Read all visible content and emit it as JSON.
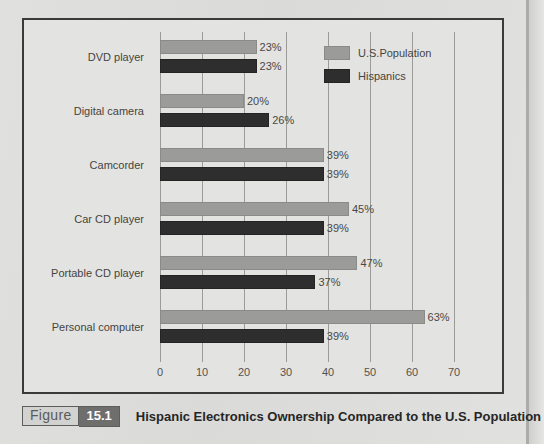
{
  "figure": {
    "label_word": "Figure",
    "number": "15.1",
    "caption": "Hispanic Electronics Ownership Compared to the U.S. Population"
  },
  "legend": {
    "position": "top-right",
    "items": [
      {
        "label": "U.S.Population",
        "color": "#9b9b99",
        "swatch": "us"
      },
      {
        "label": "Hispanics",
        "color": "#2e2e2e",
        "swatch": "hisp"
      }
    ]
  },
  "chart_data": {
    "type": "bar",
    "orientation": "horizontal",
    "title": "Hispanic Electronics Ownership Compared to the U.S. Population",
    "xlabel": "",
    "ylabel": "",
    "xlim": [
      0,
      70
    ],
    "grid": true,
    "legend_position": "top-right",
    "value_suffix": "%",
    "tick_labels": [
      "0",
      "10",
      "20",
      "30",
      "40",
      "50",
      "60",
      "70"
    ],
    "ticks": [
      0,
      10,
      20,
      30,
      40,
      50,
      60,
      70
    ],
    "categories": [
      "DVD player",
      "Digital camera",
      "Camcorder",
      "Car CD player",
      "Portable CD player",
      "Personal computer"
    ],
    "series": [
      {
        "name": "U.S.Population",
        "color": "#9b9b99",
        "values": [
          23,
          20,
          39,
          45,
          47,
          63
        ],
        "labels": [
          "23%",
          "20%",
          "39%",
          "45%",
          "47%",
          "63%"
        ]
      },
      {
        "name": "Hispanics",
        "color": "#2e2e2e",
        "values": [
          23,
          26,
          39,
          39,
          37,
          39
        ],
        "labels": [
          "23%",
          "26%",
          "39%",
          "39%",
          "37%",
          "39%"
        ]
      }
    ]
  }
}
